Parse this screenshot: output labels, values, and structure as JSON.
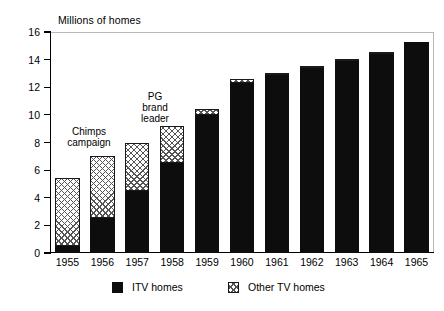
{
  "chart_data": {
    "type": "bar",
    "title": "Millions of homes",
    "subtitle": "",
    "xlabel": "",
    "ylabel": "Millions of homes",
    "ylim": [
      0,
      16
    ],
    "ytick_values": [
      0,
      2,
      4,
      6,
      8,
      10,
      12,
      14,
      16
    ],
    "ytick_labels": [
      "0",
      "2",
      "4",
      "6",
      "8",
      "10",
      "12",
      "14",
      "16"
    ],
    "grid": false,
    "stacked": true,
    "legend_position": "bottom",
    "categories": [
      "1955",
      "1956",
      "1957",
      "1958",
      "1959",
      "1960",
      "1961",
      "1962",
      "1963",
      "1964",
      "1965"
    ],
    "series": [
      {
        "name": "ITV homes",
        "color": "#0d0d0d",
        "fill": "solid",
        "values": [
          0.5,
          2.5,
          4.5,
          6.5,
          10.0,
          12.3,
          12.9,
          13.4,
          13.9,
          14.4,
          15.3
        ]
      },
      {
        "name": "Other TV homes",
        "color": "#ffffff",
        "fill": "checkered",
        "values": [
          4.9,
          4.5,
          3.5,
          2.7,
          0.4,
          0.3,
          0.1,
          0.1,
          0.1,
          0.1,
          0.0
        ]
      }
    ],
    "totals": [
      5.4,
      7.0,
      8.0,
      9.2,
      10.4,
      12.6,
      13.0,
      13.5,
      14.0,
      14.5,
      15.3
    ],
    "annotations": [
      {
        "id": "chimps",
        "text": "Chimps\ncampaign"
      },
      {
        "id": "pg",
        "text": "PG\nbrand\nleader"
      }
    ]
  },
  "legend": {
    "items": [
      {
        "label": "ITV homes",
        "swatch": "solid-black"
      },
      {
        "label": "Other TV homes",
        "swatch": "checkered"
      }
    ]
  }
}
